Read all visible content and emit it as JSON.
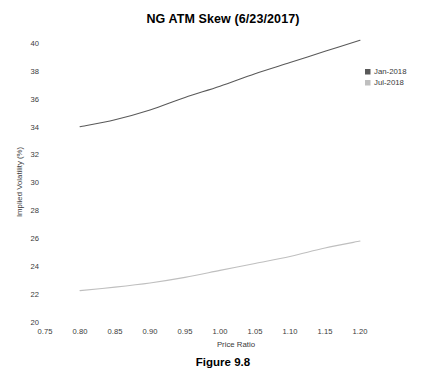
{
  "chart": {
    "title": "NG ATM Skew (6/23/2017)",
    "caption": "Figure 9.8"
  },
  "axes": {
    "x_title": "Price Ratio",
    "y_title": "Implied Volatility (%)",
    "x_ticks": [
      "0.75",
      "0.80",
      "0.85",
      "0.90",
      "0.95",
      "1.00",
      "1.05",
      "1.10",
      "1.15",
      "1.20"
    ],
    "y_ticks": [
      "20",
      "22",
      "24",
      "26",
      "28",
      "30",
      "32",
      "34",
      "36",
      "38",
      "40"
    ]
  },
  "legend": {
    "items": [
      {
        "label": "Jan-2018",
        "color": "#595959"
      },
      {
        "label": "Jul-2018",
        "color": "#bfbfbf"
      }
    ]
  },
  "chart_data": {
    "type": "line",
    "title": "NG ATM Skew (6/23/2017)",
    "xlabel": "Price Ratio",
    "ylabel": "Implied Volatility (%)",
    "xlim": [
      0.75,
      1.2
    ],
    "ylim": [
      20,
      40
    ],
    "xticks": [
      0.75,
      0.8,
      0.85,
      0.9,
      0.95,
      1.0,
      1.05,
      1.1,
      1.15,
      1.2
    ],
    "yticks": [
      20,
      22,
      24,
      26,
      28,
      30,
      32,
      34,
      36,
      38,
      40
    ],
    "grid": false,
    "legend_position": "right",
    "x": [
      0.8,
      0.85,
      0.9,
      0.95,
      1.0,
      1.05,
      1.1,
      1.15,
      1.2
    ],
    "series": [
      {
        "name": "Jan-2018",
        "color": "#595959",
        "values": [
          34.0,
          34.5,
          35.2,
          36.1,
          36.9,
          37.8,
          38.6,
          39.4,
          40.2
        ]
      },
      {
        "name": "Jul-2018",
        "color": "#bfbfbf",
        "values": [
          22.25,
          22.5,
          22.8,
          23.2,
          23.7,
          24.2,
          24.7,
          25.3,
          25.8
        ]
      }
    ]
  }
}
